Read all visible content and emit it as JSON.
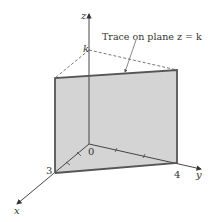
{
  "diagram": {
    "annotation": "Trace on plane z = k",
    "labels": {
      "z_axis": "z",
      "x_axis": "x",
      "y_axis": "y",
      "origin": "0",
      "k": "k",
      "x_intercept": "3",
      "y_intercept": "4"
    },
    "colors": {
      "plane_fill": "#d4d4d4",
      "plane_edge": "#555555",
      "axis": "#333333",
      "dashed": "#555555"
    }
  }
}
